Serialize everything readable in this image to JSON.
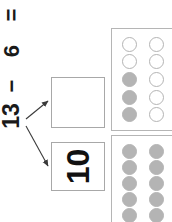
{
  "worksheet": {
    "orientation": "rotated-90-ccw",
    "equation": {
      "minuend": "13",
      "operator": "−",
      "subtrahend": "6",
      "equals": "=",
      "full_text": "13 − 6 ="
    },
    "number_bond": {
      "boxes": [
        {
          "name": "top-part-box",
          "value": "",
          "filled": false
        },
        {
          "name": "bottom-part-box",
          "value": "10",
          "filled": true
        }
      ],
      "arrow_count": 2
    },
    "ten_frames": [
      {
        "name": "ten-frame-top",
        "rows": 5,
        "columns": 2,
        "total_cells": 10,
        "filled_count": 3,
        "cells": [
          "empty",
          "empty",
          "empty",
          "empty",
          "filled",
          "empty",
          "filled",
          "empty",
          "filled",
          "empty"
        ]
      },
      {
        "name": "ten-frame-bottom",
        "rows": 5,
        "columns": 2,
        "total_cells": 10,
        "filled_count": 10,
        "cells": [
          "filled",
          "filled",
          "filled",
          "filled",
          "filled",
          "filled",
          "filled",
          "filled",
          "filled",
          "filled"
        ]
      }
    ],
    "colors": {
      "dot_gray": "#b4b4b4",
      "box_border": "#a8a8a8",
      "frame_border": "#b5b5b5",
      "text": "#111111",
      "arrow": "#4a4a4a",
      "background": "#ffffff"
    }
  }
}
